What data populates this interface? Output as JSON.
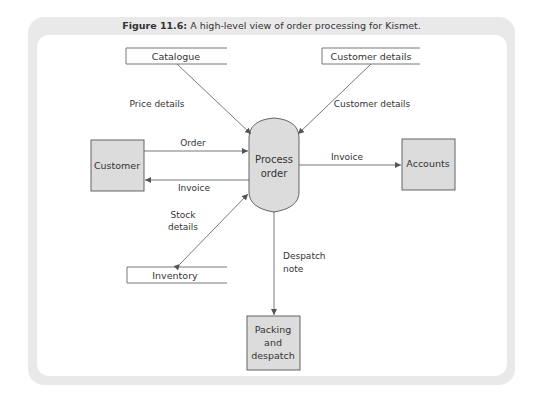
{
  "figure": {
    "label": "Figure 11.6:",
    "caption": "A high-level view of order processing for Kismet."
  },
  "colors": {
    "frame": "#e9e9e9",
    "entity_fill": "#dcdcdc",
    "line": "#555555",
    "text": "#333333"
  },
  "process": {
    "lines": [
      "Process",
      "order"
    ]
  },
  "entities": {
    "customer": {
      "lines": [
        "Customer"
      ]
    },
    "accounts": {
      "lines": [
        "Accounts"
      ]
    },
    "packing": {
      "lines": [
        "Packing",
        "and",
        "despatch"
      ]
    }
  },
  "stores": {
    "catalogue": "Catalogue",
    "customer_details": "Customer details",
    "inventory": "Inventory"
  },
  "flows": {
    "price_details": "Price details",
    "customer_details": "Customer details",
    "order": "Order",
    "invoice_to_customer": "Invoice",
    "invoice_to_accounts": "Invoice",
    "stock_details": [
      "Stock",
      "details"
    ],
    "despatch_note": [
      "Despatch",
      "note"
    ]
  }
}
